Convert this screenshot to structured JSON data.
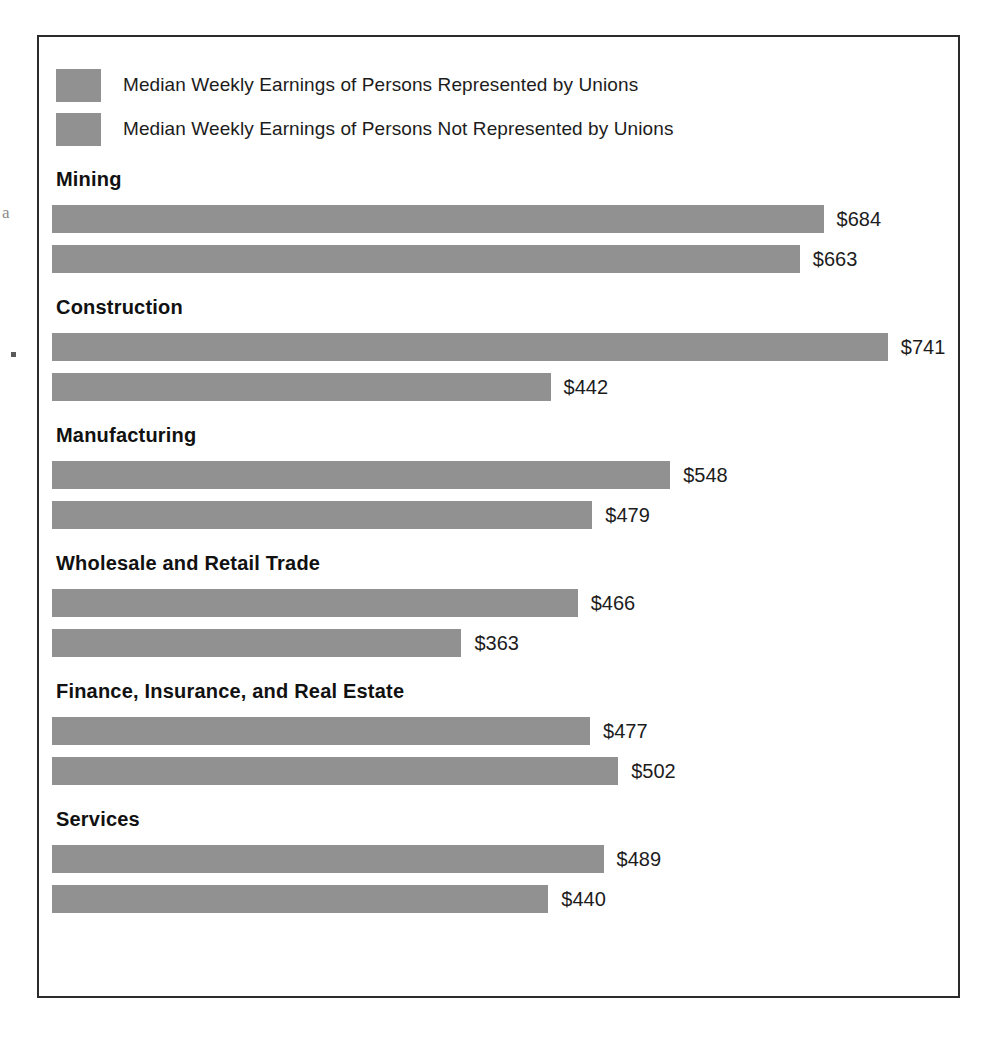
{
  "legend": {
    "items": [
      {
        "label": "Median Weekly Earnings of Persons Represented by Unions",
        "color": "#919191",
        "swatch_name": "legend-swatch-represented"
      },
      {
        "label": "Median Weekly Earnings of Persons Not Represented by Unions",
        "color": "#919191",
        "swatch_name": "legend-swatch-not-represented"
      }
    ]
  },
  "artifacts": {
    "margin_letter": "a"
  },
  "chart_data": {
    "type": "bar",
    "orientation": "horizontal",
    "title": "",
    "subtitle": "",
    "xlabel": "",
    "ylabel": "",
    "grid": false,
    "legend_position": "top-left",
    "axis_visible": false,
    "value_prefix": "$",
    "xlim": [
      0,
      741
    ],
    "px_per_unit": 1.128,
    "categories": [
      "Mining",
      "Construction",
      "Manufacturing",
      "Wholesale and Retail Trade",
      "Finance, Insurance, and Real Estate",
      "Services"
    ],
    "series": [
      {
        "name": "Median Weekly Earnings of Persons Represented by Unions",
        "color": "#919191",
        "values": [
          684,
          741,
          548,
          466,
          477,
          489
        ],
        "labels": [
          "$684",
          "$741",
          "$548",
          "$466",
          "$477",
          "$489"
        ]
      },
      {
        "name": "Median Weekly Earnings of Persons Not Represented by Unions",
        "color": "#919191",
        "values": [
          663,
          442,
          479,
          363,
          502,
          440
        ],
        "labels": [
          "$663",
          "$442",
          "$479",
          "$363",
          "$502",
          "$440"
        ]
      }
    ]
  }
}
